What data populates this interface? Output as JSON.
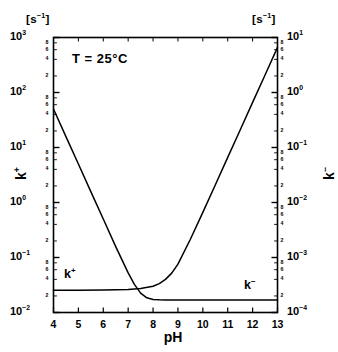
{
  "chart_data": {
    "type": "line",
    "title": "",
    "annotation": "T = 25°C",
    "xlabel": "pH",
    "xlim": [
      4,
      13
    ],
    "xticks": [
      4,
      5,
      6,
      7,
      8,
      9,
      10,
      11,
      12,
      13
    ],
    "xtick_labels": [
      "4",
      "5",
      "6",
      "7",
      "8",
      "9",
      "10",
      "11",
      "12",
      "13"
    ],
    "grid": false,
    "legend": "inline-curve-labels",
    "yscale": "log",
    "left_axis": {
      "title_base": "k",
      "title_sup": "+",
      "unit_base": "[s",
      "unit_sup": "-1",
      "unit_tail": "]",
      "ylim": [
        0.01,
        1000
      ],
      "decade_labels": [
        "10³",
        "10²",
        "10¹",
        "10⁰",
        "10⁻¹",
        "10⁻²"
      ],
      "decade_exponents": [
        "3",
        "2",
        "1",
        "0",
        "-1",
        "-2"
      ],
      "minor_tick_labels": [
        "8",
        "6",
        "4",
        "2"
      ]
    },
    "right_axis": {
      "title_base": "k",
      "title_sup": "-",
      "unit_base": "[s",
      "unit_sup": "-1",
      "unit_tail": "]",
      "ylim": [
        0.0001,
        10
      ],
      "decade_labels": [
        "10¹",
        "10⁰",
        "10⁻¹",
        "10⁻²",
        "10⁻³",
        "10⁻⁴"
      ],
      "decade_exponents": [
        "1",
        "0",
        "-1",
        "-2",
        "-3",
        "-4"
      ],
      "minor_tick_labels": [
        "8",
        "6",
        "4",
        "2"
      ]
    },
    "series": [
      {
        "name": "k+",
        "label": "k⁺",
        "label_base": "k",
        "label_sup": "+",
        "axis": "left",
        "description": "Acid-catalysed rate constant: slope -1 decade per pH unit at low pH, levels off to a plateau at high pH.",
        "x": [
          4.0,
          4.5,
          5.0,
          5.5,
          6.0,
          6.5,
          7.0,
          7.25,
          7.5,
          7.75,
          8.0,
          8.25,
          8.5,
          8.75,
          9.0,
          9.5,
          10.0,
          11.0,
          12.0,
          13.0
        ],
        "y": [
          50.0,
          15.8,
          5.0,
          1.58,
          0.5,
          0.158,
          0.0525,
          0.0325,
          0.0225,
          0.0185,
          0.0173,
          0.017,
          0.0169,
          0.0168,
          0.0168,
          0.0168,
          0.0168,
          0.0168,
          0.0168,
          0.0168
        ]
      },
      {
        "name": "k-",
        "label": "k⁻",
        "label_base": "k",
        "label_sup": "−",
        "axis": "left",
        "description": "Base-catalysed rate constant plotted on the left scale: flat plateau at low pH, rising +1 decade per pH unit above pH 9 up to ~8 x 10^0 at pH 13 (right scale 8 x 10^0... i.e. 10^1 decade).",
        "x": [
          4.0,
          5.0,
          6.0,
          7.0,
          7.5,
          8.0,
          8.25,
          8.5,
          8.75,
          9.0,
          9.5,
          10.0,
          10.5,
          11.0,
          11.5,
          12.0,
          12.5,
          13.0
        ],
        "y": [
          0.0255,
          0.0255,
          0.0256,
          0.0262,
          0.0272,
          0.03,
          0.0335,
          0.04,
          0.052,
          0.076,
          0.215,
          0.66,
          2.08,
          6.6,
          20.8,
          66.0,
          208.0,
          660.0
        ]
      }
    ],
    "curve_labels": {
      "left": {
        "base": "k",
        "sup": "+"
      },
      "right": {
        "base": "k",
        "sup": "−"
      }
    },
    "crossover": {
      "pH": 7.8,
      "value": 0.021
    }
  }
}
